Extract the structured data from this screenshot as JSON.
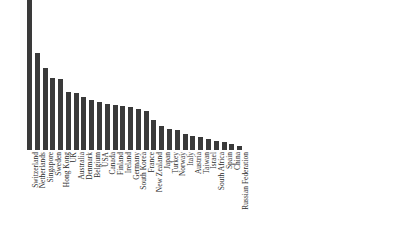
{
  "chart_data": {
    "type": "bar",
    "title": "",
    "subtitle": "",
    "xlabel": "",
    "ylabel": "",
    "grid": false,
    "legend": null,
    "axis_visible": false,
    "tick_labels_y": [],
    "orientation": "vertical",
    "bar_color": "#3a3a3a",
    "background_color": "#ffffff",
    "label_rotation_deg": -90,
    "note_first_bar_clipped": "Switzerland bar extends to the top edge of the image and is cut off",
    "note_last_label_clipped": "Russian Federation label is clipped at the right/bottom image edge, rendering as 'n Federation'",
    "ylim": [
      0,
      150
    ],
    "categories": [
      "Switzerland",
      "Netherlands",
      "Singapore",
      "Sweden",
      "Hong Kong",
      "UK",
      "Australia",
      "Denmark",
      "Belgium",
      "USA",
      "Canada",
      "Finland",
      "Ireland",
      "Germany",
      "South Korea",
      "France",
      "New Zealand",
      "Japan",
      "Turkey",
      "Norway",
      "Italy",
      "Austria",
      "Taiwan",
      "Israel",
      "South Africa",
      "Spain",
      "China",
      "Russian Federation"
    ],
    "values": [
      150,
      97,
      82,
      72,
      71,
      58,
      57,
      53,
      50,
      48,
      46,
      45,
      44,
      43,
      41,
      39,
      30,
      24,
      21,
      20,
      16,
      14,
      13,
      11,
      9,
      8,
      6,
      4
    ]
  }
}
